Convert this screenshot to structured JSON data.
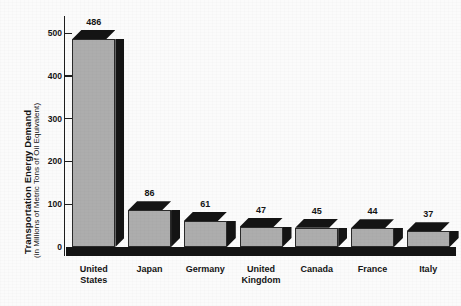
{
  "chart_data": {
    "type": "bar",
    "title": "",
    "subtitle": "",
    "xlabel": "",
    "ylabel": "Transportation Energy Demand",
    "ylabel_sub": "(in Millions of Metric Tons of Oil Equivalent)",
    "categories": [
      "United States",
      "Japan",
      "Germany",
      "United Kingdom",
      "Canada",
      "France",
      "Italy"
    ],
    "category_lines": [
      [
        "United",
        "States"
      ],
      [
        "Japan"
      ],
      [
        "Germany"
      ],
      [
        "United",
        "Kingdom"
      ],
      [
        "Canada"
      ],
      [
        "France"
      ],
      [
        "Italy"
      ]
    ],
    "values": [
      486,
      86,
      61,
      47,
      45,
      44,
      37
    ],
    "value_labels": [
      "486",
      "86",
      "61",
      "47",
      "45",
      "44",
      "37"
    ],
    "ylim": [
      0,
      540
    ],
    "yticks": [
      0,
      100,
      200,
      300,
      400,
      500
    ],
    "ytick_labels": [
      "0",
      "100",
      "200",
      "300",
      "400",
      "500"
    ],
    "grid": false,
    "legend": false,
    "legend_position": "none",
    "bar_style": "3d-extruded",
    "colors": {
      "bar_face": "#adadad",
      "bar_depth": "#141414",
      "bar_outline": "#2a2a2a",
      "axis": "#1d1d1d",
      "text": "#141414",
      "background": "#fbfbfb"
    }
  }
}
